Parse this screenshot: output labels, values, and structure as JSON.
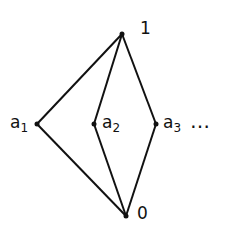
{
  "diagram": {
    "type": "hasse-diagram",
    "nodes": [
      {
        "id": "top",
        "label": "1",
        "x": 122,
        "y": 34
      },
      {
        "id": "bottom",
        "label": "0",
        "x": 126,
        "y": 216
      },
      {
        "id": "a1",
        "label": "a",
        "sub": "1",
        "x": 37,
        "y": 124
      },
      {
        "id": "a2",
        "label": "a",
        "sub": "2",
        "x": 94,
        "y": 124
      },
      {
        "id": "a3",
        "label": "a",
        "sub": "3",
        "x": 156,
        "y": 124
      }
    ],
    "edges": [
      [
        "top",
        "a1"
      ],
      [
        "top",
        "a2"
      ],
      [
        "top",
        "a3"
      ],
      [
        "a1",
        "bottom"
      ],
      [
        "a2",
        "bottom"
      ],
      [
        "a3",
        "bottom"
      ]
    ],
    "continuation": "…",
    "line_color": "#111111"
  }
}
